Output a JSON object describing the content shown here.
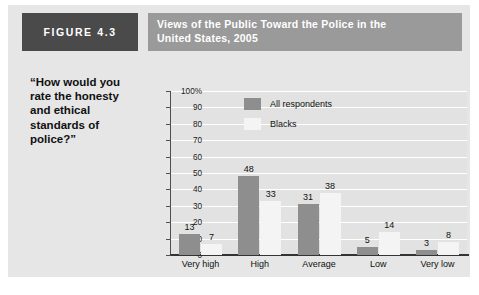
{
  "figure": {
    "tag": "FIGURE 4.3",
    "title_line_1": "Views of the Public Toward the Police in the",
    "title_line_2": "United States, 2005",
    "question": "“How would you rate the honesty and ethical standards of police?”"
  },
  "colors": {
    "panel_background": "#e6e6e6",
    "plot_background": "#e2e2e2",
    "tag_background": "#4a4a4a",
    "title_band_background": "#9a9a9a",
    "series_all_respondents": "#8e8e8e",
    "series_blacks": "#f4f4f4",
    "gridline": "#ffffff",
    "axis": "#333333"
  },
  "chart_data": {
    "type": "bar",
    "title": "Views of the Public Toward the Police in the United States, 2005",
    "subtitle": "“How would you rate the honesty and ethical standards of police?”",
    "xlabel": "",
    "ylabel": "",
    "categories": [
      "Very high",
      "High",
      "Average",
      "Low",
      "Very low"
    ],
    "series": [
      {
        "name": "All respondents",
        "values": [
          13,
          48,
          31,
          5,
          3
        ]
      },
      {
        "name": "Blacks",
        "values": [
          7,
          33,
          38,
          14,
          8
        ]
      }
    ],
    "ylim": [
      0,
      100
    ],
    "yticks": [
      0,
      10,
      20,
      30,
      40,
      50,
      60,
      70,
      80,
      90,
      100
    ],
    "ytick_labels": [
      "0",
      "10",
      "20",
      "30",
      "40",
      "50",
      "60",
      "70",
      "80",
      "90",
      "100%"
    ],
    "grid": true,
    "legend_position": "upper-center",
    "data_labels": true
  }
}
